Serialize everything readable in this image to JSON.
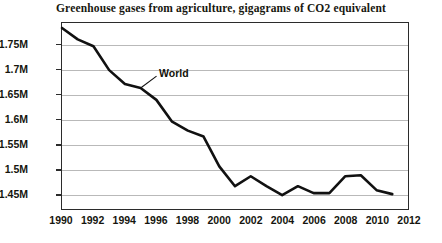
{
  "chart_data": {
    "type": "line",
    "title": "Greenhouse gases from agriculture, gigagrams of CO2 equivalent",
    "xlabel": "",
    "ylabel": "",
    "grid": true,
    "legend_position": "inline-annotation",
    "xlim": [
      1990,
      2012
    ],
    "ylim": [
      1420000,
      1795000
    ],
    "ytick_labels": [
      "1.75M",
      "1.7M",
      "1.65M",
      "1.6M",
      "1.55M",
      "1.5M",
      "1.45M"
    ],
    "ytick_values": [
      1750000,
      1700000,
      1650000,
      1600000,
      1550000,
      1500000,
      1450000
    ],
    "xtick_labels": [
      "1990",
      "1992",
      "1994",
      "1996",
      "1998",
      "2000",
      "2002",
      "2004",
      "2006",
      "2008",
      "2010",
      "2012"
    ],
    "xtick_values": [
      1990,
      1992,
      1994,
      1996,
      1998,
      2000,
      2002,
      2004,
      2006,
      2008,
      2010,
      2012
    ],
    "series": [
      {
        "name": "World",
        "color": "#111111",
        "annotation_label": "World",
        "x": [
          1990,
          1991,
          1992,
          1993,
          1994,
          1995,
          1996,
          1997,
          1998,
          1999,
          2000,
          2001,
          2002,
          2003,
          2004,
          2005,
          2006,
          2007,
          2008,
          2009,
          2010,
          2011
        ],
        "values": [
          1785000,
          1762000,
          1748000,
          1700000,
          1672000,
          1664000,
          1640000,
          1596000,
          1578000,
          1566000,
          1506000,
          1466000,
          1486000,
          1466000,
          1448000,
          1466000,
          1452000,
          1452000,
          1486000,
          1488000,
          1458000,
          1450000
        ]
      }
    ]
  },
  "annotation": {
    "label": "World"
  }
}
